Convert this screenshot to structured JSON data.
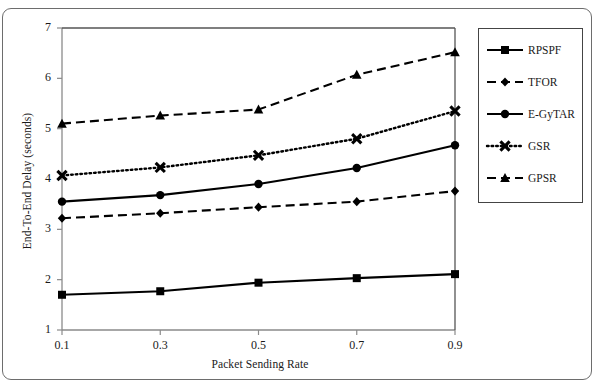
{
  "chart_data": {
    "type": "line",
    "title": "",
    "xlabel": "Packet Sending Rate",
    "ylabel": "End-To-End Delay (seconds)",
    "x": [
      0.1,
      0.3,
      0.5,
      0.7,
      0.9
    ],
    "xticklabels": [
      "0.1",
      "0.3",
      "0.5",
      "0.7",
      "0.9"
    ],
    "yticklabels": [
      "1",
      "2",
      "3",
      "4",
      "5",
      "6",
      "7"
    ],
    "xlim": [
      0.1,
      0.9
    ],
    "ylim": [
      1,
      7
    ],
    "grid": false,
    "legend_position": "right-outside",
    "series": [
      {
        "name": "RPSPF",
        "values": [
          1.7,
          1.77,
          1.94,
          2.03,
          2.11
        ],
        "linestyle": "solid",
        "marker": "square",
        "color": "#000000"
      },
      {
        "name": "TFOR",
        "values": [
          3.22,
          3.32,
          3.44,
          3.55,
          3.76
        ],
        "linestyle": "dashed",
        "marker": "diamond",
        "color": "#000000"
      },
      {
        "name": "E-GyTAR",
        "values": [
          3.55,
          3.68,
          3.9,
          4.22,
          4.67
        ],
        "linestyle": "solid",
        "marker": "circle",
        "color": "#000000"
      },
      {
        "name": "GSR",
        "values": [
          4.07,
          4.23,
          4.47,
          4.8,
          5.35
        ],
        "linestyle": "dotted",
        "marker": "x",
        "color": "#000000"
      },
      {
        "name": "GPSR",
        "values": [
          5.1,
          5.26,
          5.38,
          6.07,
          6.52
        ],
        "linestyle": "dashed",
        "marker": "triangle",
        "color": "#000000"
      }
    ]
  },
  "legend": {
    "items": [
      {
        "label": "RPSPF",
        "marker": "square-marker-icon"
      },
      {
        "label": "TFOR",
        "marker": "diamond-marker-icon"
      },
      {
        "label": "E-GyTAR",
        "marker": "circle-marker-icon"
      },
      {
        "label": "GSR",
        "marker": "x-marker-icon"
      },
      {
        "label": "GPSR",
        "marker": "triangle-marker-icon"
      }
    ]
  },
  "axes": {
    "x_title": "Packet Sending Rate",
    "y_title": "End-To-End Delay (seconds)",
    "x_ticks": [
      "0.1",
      "0.3",
      "0.5",
      "0.7",
      "0.9"
    ],
    "y_ticks": [
      "1",
      "2",
      "3",
      "4",
      "5",
      "6",
      "7"
    ]
  }
}
